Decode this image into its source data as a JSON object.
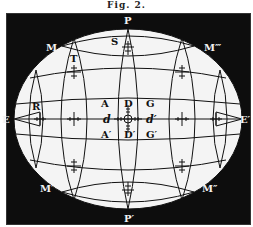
{
  "caption": "Fig. 2.",
  "figure": {
    "colors": {
      "background": "#0d0d0d",
      "globe": "#f4f4f4",
      "lines": "#111111"
    },
    "labels": {
      "pole_top": "P",
      "pole_bottom": "P′",
      "east_left": "E",
      "east_right": "E′",
      "m_top_left": "M",
      "m_top_right": "M‴",
      "m_bottom_left": "M′",
      "m_bottom_right": "M″",
      "s": "S",
      "t": "T",
      "r": "R",
      "a": "A",
      "d": "D",
      "g": "G",
      "a_prime": "A′",
      "d_prime": "D′",
      "g_prime": "G′",
      "d_small": "d",
      "d_small_prime": "d′"
    }
  }
}
